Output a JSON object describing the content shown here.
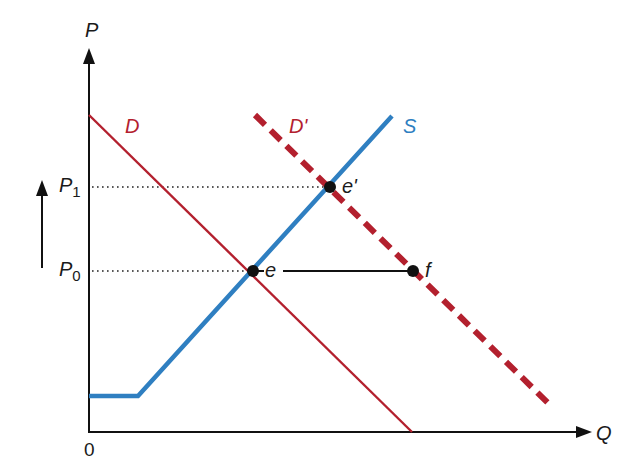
{
  "diagram": {
    "title": "",
    "axes": {
      "y_label": "P",
      "x_label": "Q",
      "origin_label": "0"
    },
    "price_levels": [
      {
        "id": "P1",
        "base": "P",
        "sub": "1",
        "y": 187
      },
      {
        "id": "P0",
        "base": "P",
        "sub": "0",
        "y": 271
      }
    ],
    "curves": [
      {
        "id": "D",
        "label": "D",
        "style": "solid",
        "color": "#b3202e",
        "points": [
          [
            89,
            115
          ],
          [
            412,
            432
          ]
        ]
      },
      {
        "id": "D_prime",
        "label": "D'",
        "style": "dashed",
        "color": "#b3202e",
        "points": [
          [
            255,
            115
          ],
          [
            550,
            405
          ]
        ]
      },
      {
        "id": "S",
        "label": "S",
        "style": "solid",
        "color": "#2f7fc1",
        "points": [
          [
            89,
            396
          ],
          [
            138,
            396
          ],
          [
            392,
            116
          ]
        ]
      }
    ],
    "points": [
      {
        "id": "e",
        "label": "e",
        "x": 253,
        "y": 271
      },
      {
        "id": "e_prime",
        "label": "e'",
        "x": 330,
        "y": 187
      },
      {
        "id": "f",
        "label": "f",
        "x": 413,
        "y": 271
      }
    ],
    "annotations": {
      "price_rise_arrow": "up-arrow",
      "horizontal_shift_segment": "e-to-f"
    },
    "colors": {
      "demand": "#b3202e",
      "supply": "#2f7fc1",
      "axis": "#111111"
    }
  }
}
